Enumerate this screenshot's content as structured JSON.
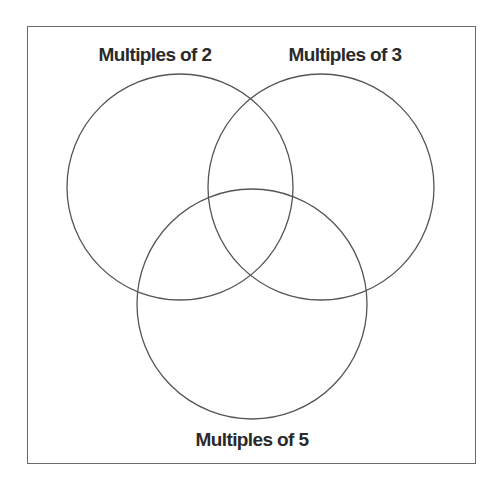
{
  "diagram": {
    "type": "venn",
    "sets": [
      {
        "label": "Multiples of 2",
        "cx": 180,
        "cy": 187,
        "r": 113,
        "label_x": 155,
        "label_y": 44
      },
      {
        "label": "Multiples of 3",
        "cx": 321,
        "cy": 187,
        "r": 113,
        "label_x": 345,
        "label_y": 44
      },
      {
        "label": "Multiples of 5",
        "cx": 252,
        "cy": 304,
        "r": 115,
        "label_x": 252,
        "label_y": 429
      }
    ],
    "stroke_color": "#555555",
    "frame_color": "#6a6a6a"
  }
}
